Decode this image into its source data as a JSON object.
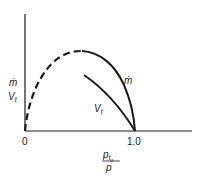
{
  "diagram": {
    "y_axis_label_top": "ṁ",
    "y_axis_label_bottom": "V",
    "y_axis_label_bottom_sub": "t",
    "x_axis_label_numerator": "p",
    "x_axis_label_numerator_sub": "t",
    "x_axis_label_numerator_subsub": "o",
    "x_axis_label_denominator": "p",
    "x_tick_0": "0",
    "x_tick_1": "1.0",
    "curve_mdot_label": "ṁ",
    "curve_vt_label": "V",
    "curve_vt_label_sub": "t",
    "line_color": "#1a1a1a"
  }
}
